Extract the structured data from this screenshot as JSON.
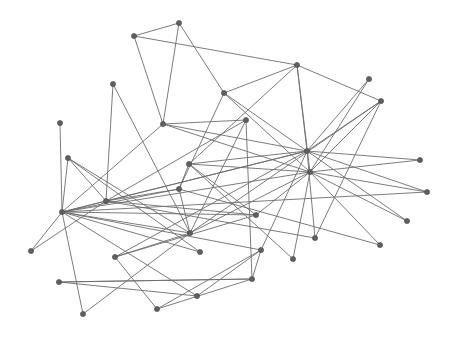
{
  "graph": {
    "width": 470,
    "height": 340,
    "background": "#ffffff",
    "node_color": "#5f5f5f",
    "edge_color": "#6e6e6e",
    "node_radius": 2.6,
    "nodes": [
      {
        "id": "n1",
        "x": 134,
        "y": 36
      },
      {
        "id": "n2",
        "x": 179,
        "y": 23
      },
      {
        "id": "n3",
        "x": 297,
        "y": 65
      },
      {
        "id": "n4",
        "x": 369,
        "y": 79
      },
      {
        "id": "n5",
        "x": 381,
        "y": 101
      },
      {
        "id": "n6",
        "x": 113,
        "y": 84
      },
      {
        "id": "n7",
        "x": 224,
        "y": 93
      },
      {
        "id": "n8",
        "x": 163,
        "y": 124
      },
      {
        "id": "n9",
        "x": 246,
        "y": 120
      },
      {
        "id": "n10",
        "x": 60,
        "y": 123
      },
      {
        "id": "n11",
        "x": 68,
        "y": 158
      },
      {
        "id": "n12",
        "x": 189,
        "y": 164
      },
      {
        "id": "n13",
        "x": 307,
        "y": 151
      },
      {
        "id": "n14",
        "x": 420,
        "y": 160
      },
      {
        "id": "n15",
        "x": 179,
        "y": 189
      },
      {
        "id": "n16",
        "x": 106,
        "y": 201
      },
      {
        "id": "n17",
        "x": 62,
        "y": 212
      },
      {
        "id": "n18",
        "x": 310,
        "y": 172
      },
      {
        "id": "n19",
        "x": 427,
        "y": 192
      },
      {
        "id": "n20",
        "x": 256,
        "y": 215
      },
      {
        "id": "n21",
        "x": 190,
        "y": 233
      },
      {
        "id": "n22",
        "x": 407,
        "y": 221
      },
      {
        "id": "n23",
        "x": 315,
        "y": 238
      },
      {
        "id": "n24",
        "x": 380,
        "y": 245
      },
      {
        "id": "n25",
        "x": 31,
        "y": 251
      },
      {
        "id": "n26",
        "x": 115,
        "y": 257
      },
      {
        "id": "n27",
        "x": 200,
        "y": 252
      },
      {
        "id": "n28",
        "x": 261,
        "y": 250
      },
      {
        "id": "n29",
        "x": 293,
        "y": 259
      },
      {
        "id": "n30",
        "x": 252,
        "y": 279
      },
      {
        "id": "n31",
        "x": 59,
        "y": 282
      },
      {
        "id": "n32",
        "x": 197,
        "y": 296
      },
      {
        "id": "n33",
        "x": 157,
        "y": 309
      },
      {
        "id": "n34",
        "x": 83,
        "y": 314
      }
    ],
    "edges": [
      [
        "n1",
        "n2"
      ],
      [
        "n1",
        "n3"
      ],
      [
        "n1",
        "n8"
      ],
      [
        "n2",
        "n8"
      ],
      [
        "n2",
        "n7"
      ],
      [
        "n3",
        "n7"
      ],
      [
        "n3",
        "n5"
      ],
      [
        "n3",
        "n13"
      ],
      [
        "n3",
        "n18"
      ],
      [
        "n3",
        "n12"
      ],
      [
        "n4",
        "n13"
      ],
      [
        "n4",
        "n18"
      ],
      [
        "n5",
        "n13"
      ],
      [
        "n5",
        "n18"
      ],
      [
        "n5",
        "n23"
      ],
      [
        "n5",
        "n21"
      ],
      [
        "n6",
        "n16"
      ],
      [
        "n6",
        "n21"
      ],
      [
        "n10",
        "n17"
      ],
      [
        "n8",
        "n9"
      ],
      [
        "n8",
        "n13"
      ],
      [
        "n8",
        "n18"
      ],
      [
        "n8",
        "n17"
      ],
      [
        "n7",
        "n15"
      ],
      [
        "n7",
        "n13"
      ],
      [
        "n7",
        "n18"
      ],
      [
        "n9",
        "n16"
      ],
      [
        "n9",
        "n21"
      ],
      [
        "n11",
        "n16"
      ],
      [
        "n11",
        "n27"
      ],
      [
        "n11",
        "n21"
      ],
      [
        "n11",
        "n17"
      ],
      [
        "n12",
        "n13"
      ],
      [
        "n12",
        "n18"
      ],
      [
        "n12",
        "n15"
      ],
      [
        "n12",
        "n29"
      ],
      [
        "n12",
        "n20"
      ],
      [
        "n13",
        "n14"
      ],
      [
        "n13",
        "n19"
      ],
      [
        "n13",
        "n22"
      ],
      [
        "n13",
        "n23"
      ],
      [
        "n13",
        "n17"
      ],
      [
        "n13",
        "n26"
      ],
      [
        "n13",
        "n28"
      ],
      [
        "n13",
        "n16"
      ],
      [
        "n18",
        "n14"
      ],
      [
        "n18",
        "n19"
      ],
      [
        "n18",
        "n22"
      ],
      [
        "n18",
        "n24"
      ],
      [
        "n18",
        "n29"
      ],
      [
        "n18",
        "n20"
      ],
      [
        "n18",
        "n17"
      ],
      [
        "n18",
        "n21"
      ],
      [
        "n15",
        "n17"
      ],
      [
        "n15",
        "n16"
      ],
      [
        "n15",
        "n21"
      ],
      [
        "n15",
        "n24"
      ],
      [
        "n17",
        "n16"
      ],
      [
        "n17",
        "n20"
      ],
      [
        "n17",
        "n21"
      ],
      [
        "n17",
        "n27"
      ],
      [
        "n17",
        "n28"
      ],
      [
        "n17",
        "n25"
      ],
      [
        "n17",
        "n34"
      ],
      [
        "n17",
        "n32"
      ],
      [
        "n17",
        "n19"
      ],
      [
        "n16",
        "n20"
      ],
      [
        "n16",
        "n25"
      ],
      [
        "n16",
        "n23"
      ],
      [
        "n26",
        "n20"
      ],
      [
        "n26",
        "n33"
      ],
      [
        "n26",
        "n21"
      ],
      [
        "n28",
        "n33"
      ],
      [
        "n28",
        "n30"
      ],
      [
        "n30",
        "n33"
      ],
      [
        "n30",
        "n31"
      ],
      [
        "n31",
        "n32"
      ],
      [
        "n31",
        "n30"
      ],
      [
        "n32",
        "n28"
      ],
      [
        "n34",
        "n21"
      ],
      [
        "n30",
        "n9"
      ]
    ]
  }
}
